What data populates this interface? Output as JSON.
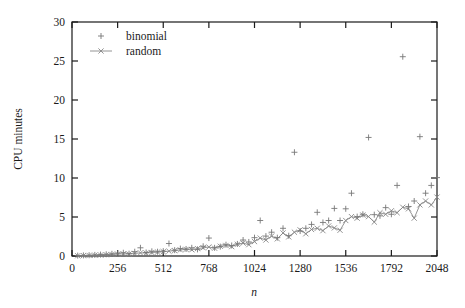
{
  "chart_data": {
    "type": "scatter",
    "title": "",
    "xlabel": "n",
    "ylabel": "CPU minutes",
    "xlim": [
      0,
      2048
    ],
    "ylim": [
      0,
      30
    ],
    "xticks": [
      0,
      256,
      512,
      768,
      1024,
      1280,
      1536,
      1792,
      2048
    ],
    "yticks": [
      0,
      5,
      10,
      15,
      20,
      25,
      30
    ],
    "xtick_labels": [
      "0",
      "256",
      "512",
      "768",
      "1024",
      "1280",
      "1536",
      "1792",
      "2048"
    ],
    "ytick_labels": [
      "0",
      "5",
      "10",
      "15",
      "20",
      "25",
      "30"
    ],
    "grid": false,
    "legend_position": "top-left",
    "frame": "box",
    "series": [
      {
        "name": "binomial",
        "marker": "plus",
        "line": false,
        "color": "#777777",
        "points": [
          [
            32,
            0.05
          ],
          [
            64,
            0.08
          ],
          [
            96,
            0.1
          ],
          [
            128,
            0.14
          ],
          [
            160,
            0.18
          ],
          [
            192,
            0.22
          ],
          [
            224,
            0.28
          ],
          [
            256,
            0.35
          ],
          [
            288,
            0.42
          ],
          [
            320,
            0.3
          ],
          [
            352,
            0.55
          ],
          [
            384,
            1.05
          ],
          [
            416,
            0.45
          ],
          [
            448,
            0.6
          ],
          [
            480,
            0.55
          ],
          [
            512,
            0.62
          ],
          [
            544,
            1.6
          ],
          [
            576,
            0.75
          ],
          [
            608,
            0.95
          ],
          [
            640,
            0.9
          ],
          [
            672,
            1.05
          ],
          [
            704,
            0.85
          ],
          [
            736,
            1.25
          ],
          [
            768,
            2.3
          ],
          [
            800,
            1.05
          ],
          [
            832,
            1.2
          ],
          [
            864,
            1.45
          ],
          [
            896,
            1.35
          ],
          [
            928,
            1.55
          ],
          [
            960,
            2.05
          ],
          [
            992,
            1.8
          ],
          [
            1024,
            2.35
          ],
          [
            1056,
            4.55
          ],
          [
            1088,
            2.55
          ],
          [
            1120,
            3.05
          ],
          [
            1152,
            2.35
          ],
          [
            1184,
            3.55
          ],
          [
            1216,
            2.6
          ],
          [
            1248,
            13.3
          ],
          [
            1280,
            3.2
          ],
          [
            1312,
            3.55
          ],
          [
            1344,
            4.05
          ],
          [
            1376,
            5.6
          ],
          [
            1408,
            4.3
          ],
          [
            1440,
            4.55
          ],
          [
            1472,
            6.1
          ],
          [
            1504,
            4.55
          ],
          [
            1536,
            6.05
          ],
          [
            1568,
            8.05
          ],
          [
            1600,
            5.05
          ],
          [
            1632,
            5.35
          ],
          [
            1664,
            15.2
          ],
          [
            1696,
            5.3
          ],
          [
            1728,
            5.15
          ],
          [
            1760,
            6.2
          ],
          [
            1792,
            5.35
          ],
          [
            1824,
            9.05
          ],
          [
            1856,
            25.55
          ],
          [
            1888,
            6.35
          ],
          [
            1920,
            7.05
          ],
          [
            1952,
            15.3
          ],
          [
            1984,
            8.05
          ],
          [
            2016,
            9.05
          ],
          [
            2048,
            10.05
          ]
        ]
      },
      {
        "name": "random",
        "marker": "cross",
        "line": true,
        "color": "#888888",
        "points": [
          [
            32,
            0.03
          ],
          [
            64,
            0.05
          ],
          [
            96,
            0.07
          ],
          [
            128,
            0.1
          ],
          [
            160,
            0.13
          ],
          [
            192,
            0.16
          ],
          [
            224,
            0.2
          ],
          [
            256,
            0.24
          ],
          [
            288,
            0.28
          ],
          [
            320,
            0.26
          ],
          [
            352,
            0.33
          ],
          [
            384,
            0.4
          ],
          [
            416,
            0.38
          ],
          [
            448,
            0.45
          ],
          [
            480,
            0.5
          ],
          [
            512,
            0.55
          ],
          [
            544,
            0.62
          ],
          [
            576,
            0.7
          ],
          [
            608,
            0.78
          ],
          [
            640,
            0.85
          ],
          [
            672,
            0.8
          ],
          [
            704,
            0.95
          ],
          [
            736,
            1.05
          ],
          [
            768,
            1.15
          ],
          [
            800,
            1.0
          ],
          [
            832,
            1.25
          ],
          [
            864,
            1.35
          ],
          [
            896,
            1.2
          ],
          [
            928,
            1.5
          ],
          [
            960,
            1.65
          ],
          [
            992,
            1.45
          ],
          [
            1024,
            1.85
          ],
          [
            1056,
            2.3
          ],
          [
            1088,
            2.05
          ],
          [
            1120,
            2.55
          ],
          [
            1152,
            2.2
          ],
          [
            1184,
            2.95
          ],
          [
            1216,
            2.45
          ],
          [
            1248,
            3.05
          ],
          [
            1280,
            3.35
          ],
          [
            1312,
            2.85
          ],
          [
            1344,
            3.4
          ],
          [
            1376,
            3.55
          ],
          [
            1408,
            3.25
          ],
          [
            1440,
            3.85
          ],
          [
            1472,
            3.6
          ],
          [
            1504,
            3.3
          ],
          [
            1536,
            4.55
          ],
          [
            1568,
            5.05
          ],
          [
            1600,
            4.85
          ],
          [
            1632,
            5.25
          ],
          [
            1664,
            5.05
          ],
          [
            1696,
            4.35
          ],
          [
            1728,
            5.55
          ],
          [
            1760,
            5.35
          ],
          [
            1792,
            5.8
          ],
          [
            1824,
            5.55
          ],
          [
            1856,
            6.25
          ],
          [
            1888,
            6.05
          ],
          [
            1920,
            4.85
          ],
          [
            1952,
            6.55
          ],
          [
            1984,
            7.05
          ],
          [
            2016,
            6.55
          ],
          [
            2048,
            7.55
          ]
        ]
      }
    ]
  },
  "legend": {
    "entries": [
      {
        "label": "binomial",
        "marker": "plus-icon",
        "has_line": false
      },
      {
        "label": "random",
        "marker": "cross-icon",
        "has_line": true
      }
    ]
  },
  "colors": {
    "axis": "#1a1a1a",
    "binomial": "#777777",
    "random": "#888888",
    "background": "#ffffff"
  }
}
